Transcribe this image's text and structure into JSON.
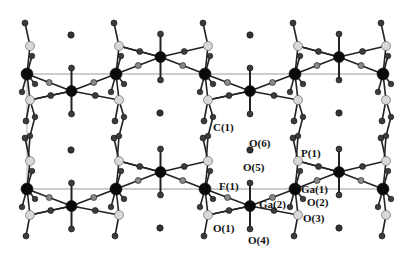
{
  "figure": {
    "colors": {
      "ga": "#0a0a0a",
      "o": "#3c3c3c",
      "o_light": "#8a8a8a",
      "p": "#d8d8d8",
      "bond": "#222222",
      "cell": "#9a9a9a",
      "water": "#333333"
    },
    "labels": [
      {
        "id": "C1",
        "text": "C(1)",
        "x": 213,
        "y": 128
      },
      {
        "id": "O6",
        "text": "O(6)",
        "x": 248,
        "y": 138
      },
      {
        "id": "O5",
        "text": "O(5)",
        "x": 243,
        "y": 166
      },
      {
        "id": "P1",
        "text": "P(1)",
        "x": 301,
        "y": 148
      },
      {
        "id": "F1",
        "text": "F(1)",
        "x": 220,
        "y": 182
      },
      {
        "id": "Ga1",
        "text": "Ga(1)",
        "x": 301,
        "y": 182
      },
      {
        "id": "Ga2",
        "text": "Ga(2)",
        "x": 259,
        "y": 200
      },
      {
        "id": "O2",
        "text": "O(2)",
        "x": 308,
        "y": 196
      },
      {
        "id": "O1",
        "text": "O(1)",
        "x": 212,
        "y": 221
      },
      {
        "id": "O3",
        "text": "O(3)",
        "x": 303,
        "y": 213
      },
      {
        "id": "O4",
        "text": "O(4)",
        "x": 248,
        "y": 235
      }
    ]
  }
}
